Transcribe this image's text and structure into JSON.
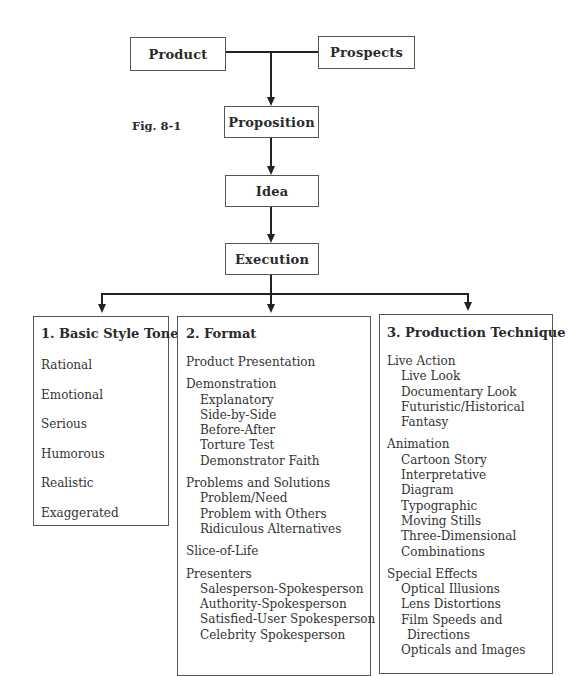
{
  "figure_label": "Fig. 8-1",
  "nodes": {
    "product": "Product",
    "prospects": "Prospects",
    "proposition": "Proposition",
    "idea": "Idea",
    "execution": "Execution"
  },
  "categories": [
    {
      "title": "1.  Basic Style Tone",
      "items": [
        "Rational",
        "Emotional",
        "Serious",
        "Humorous",
        "Realistic",
        "Exaggerated"
      ]
    },
    {
      "title": "2.  Format",
      "groups": [
        {
          "heading": "Product Presentation",
          "items": []
        },
        {
          "heading": "Demonstration",
          "items": [
            "Explanatory",
            "Side-by-Side",
            "Before-After",
            "Torture Test",
            "Demonstrator Faith"
          ]
        },
        {
          "heading": "Problems and Solutions",
          "items": [
            "Problem/Need",
            "Problem with Others",
            "Ridiculous Alternatives"
          ]
        },
        {
          "heading": "Slice-of-Life",
          "items": []
        },
        {
          "heading": "Presenters",
          "items": [
            "Salesperson-Spokesperson",
            "Authority-Spokesperson",
            "Satisfied-User Spokesperson",
            "Celebrity Spokesperson"
          ]
        }
      ]
    },
    {
      "title": "3.  Production Technique",
      "groups": [
        {
          "heading": "Live Action",
          "items": [
            "Live Look",
            "Documentary Look",
            "Futuristic/Historical",
            "Fantasy"
          ]
        },
        {
          "heading": "Animation",
          "items": [
            "Cartoon Story",
            "Interpretative",
            "Diagram",
            "Typographic",
            "Moving Stills",
            "Three-Dimensional",
            "Combinations"
          ]
        },
        {
          "heading": "Special Effects",
          "items": [
            "Optical Illusions",
            "Lens Distortions",
            "Film Speeds and",
            "Directions",
            "Opticals and Images"
          ]
        }
      ]
    }
  ]
}
